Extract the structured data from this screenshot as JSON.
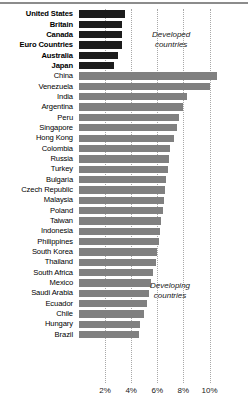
{
  "chart_data": {
    "type": "bar",
    "title": "",
    "xlabel": "",
    "ylabel": "",
    "orientation": "horizontal",
    "xlim": [
      0,
      11
    ],
    "grid": true,
    "xticks": [
      "2%",
      "4%",
      "6%",
      "8%",
      "10%"
    ],
    "xtick_values": [
      2,
      4,
      6,
      8,
      10
    ],
    "legend": [
      {
        "label": "Developed countries",
        "color": "#1c1c1c"
      },
      {
        "label": "Developing countries",
        "color": "#808080"
      }
    ],
    "annotations": [
      {
        "text_line1": "Developed",
        "text_line2": "countries"
      },
      {
        "text_line1": "Developing",
        "text_line2": "countries"
      }
    ],
    "categories": [
      "United States",
      "Britain",
      "Canada",
      "Euro Countries",
      "Australia",
      "Japan",
      "China",
      "Venezuela",
      "India",
      "Argentina",
      "Peru",
      "Singapore",
      "Hong Kong",
      "Colombia",
      "Russia",
      "Turkey",
      "Bulgaria",
      "Czech Republic",
      "Malaysia",
      "Poland",
      "Taiwan",
      "Indonesia",
      "Philippines",
      "South Korea",
      "Thailand",
      "South Africa",
      "Mexico",
      "Saudi Arabia",
      "Ecuador",
      "Chile",
      "Hungary",
      "Brazil"
    ],
    "values": [
      3.5,
      3.3,
      3.3,
      3.3,
      3.0,
      2.7,
      10.6,
      10.0,
      8.3,
      8.0,
      7.7,
      7.5,
      7.3,
      7.0,
      6.9,
      6.8,
      6.7,
      6.6,
      6.5,
      6.4,
      6.3,
      6.2,
      6.1,
      6.0,
      5.9,
      5.7,
      5.5,
      5.4,
      5.2,
      5.0,
      4.7,
      4.6
    ],
    "groups": [
      "developed",
      "developed",
      "developed",
      "developed",
      "developed",
      "developed",
      "developing",
      "developing",
      "developing",
      "developing",
      "developing",
      "developing",
      "developing",
      "developing",
      "developing",
      "developing",
      "developing",
      "developing",
      "developing",
      "developing",
      "developing",
      "developing",
      "developing",
      "developing",
      "developing",
      "developing",
      "developing",
      "developing",
      "developing",
      "developing",
      "developing",
      "developing"
    ],
    "colors": {
      "developed": "#1c1c1c",
      "developing": "#808080",
      "grid": "#a8a8a8",
      "background": "#ffffff"
    }
  }
}
